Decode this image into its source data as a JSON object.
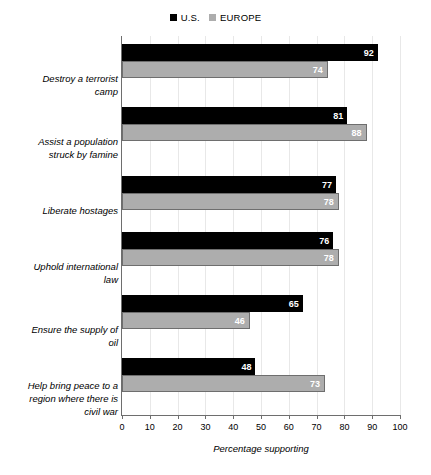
{
  "chart_data": {
    "type": "bar",
    "orientation": "horizontal",
    "title": "",
    "xlabel": "Percentage supporting",
    "ylabel": "",
    "xlim": [
      0,
      100
    ],
    "xticks": [
      0,
      10,
      20,
      30,
      40,
      50,
      60,
      70,
      80,
      90,
      100
    ],
    "grid": true,
    "legend_position": "top-center",
    "categories": [
      "Destroy a terrorist camp",
      "Assist a population struck by famine",
      "Liberate hostages",
      "Uphold international law",
      "Ensure the supply of oil",
      "Help bring peace to a region where there is civil war"
    ],
    "series": [
      {
        "name": "U.S.",
        "color": "#000000",
        "values": [
          92,
          81,
          77,
          76,
          65,
          48
        ]
      },
      {
        "name": "EUROPE",
        "color": "#adadad",
        "values": [
          74,
          88,
          78,
          78,
          46,
          73
        ]
      }
    ]
  },
  "legend": {
    "entries": [
      {
        "label": "U.S.",
        "swatch": "black-square-icon"
      },
      {
        "label": "EUROPE",
        "swatch": "gray-square-icon"
      }
    ]
  },
  "axis": {
    "x_title": "Percentage supporting",
    "tick_labels": [
      "0",
      "10",
      "20",
      "30",
      "40",
      "50",
      "60",
      "70",
      "80",
      "90",
      "100"
    ]
  },
  "categories": [
    {
      "line1": "Destroy a terrorist",
      "line2": "camp",
      "line3": ""
    },
    {
      "line1": "Assist a population",
      "line2": "struck by famine",
      "line3": ""
    },
    {
      "line1": "Liberate hostages",
      "line2": "",
      "line3": ""
    },
    {
      "line1": "Uphold international",
      "line2": "law",
      "line3": ""
    },
    {
      "line1": "Ensure the supply of",
      "line2": "oil",
      "line3": ""
    },
    {
      "line1": "Help bring peace to a",
      "line2": "region where there is",
      "line3": "civil war"
    }
  ],
  "values": {
    "us": [
      "92",
      "81",
      "77",
      "76",
      "65",
      "48"
    ],
    "europe": [
      "74",
      "88",
      "78",
      "78",
      "46",
      "73"
    ]
  }
}
